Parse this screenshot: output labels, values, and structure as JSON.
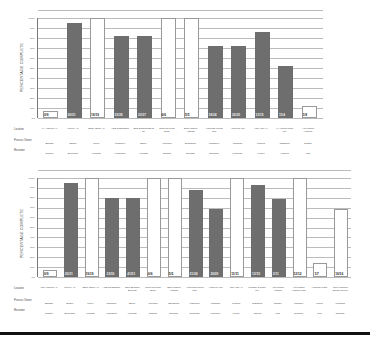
{
  "charts": [
    {
      "ylabel": "PERCENTAGE COMPLETE",
      "yticks": [
        "0%",
        "10%",
        "20%",
        "30%",
        "40%",
        "50%",
        "60%",
        "70%",
        "80%",
        "90%",
        "100%"
      ],
      "row_labels": [
        "Location",
        "Process Owner",
        "Reviewer"
      ],
      "columns": [
        {
          "value_label": "0/9",
          "pct": 0,
          "style": "frame",
          "location": "LA Angeles Air",
          "owner": "Bigham",
          "reviewer": "Dimalo"
        },
        {
          "value_label": "20/21",
          "pct": 95,
          "style": "bar",
          "location": "Loveny Air",
          "owner": "Shafer",
          "reviewer": "Brunnode"
        },
        {
          "value_label": "19/19",
          "pct": 100,
          "style": "frame",
          "location": "Saldy Office Air",
          "owner": "Tuney",
          "reviewer": "Mientak"
        },
        {
          "value_label": "23/28",
          "pct": 82,
          "style": "bar",
          "location": "AGE Roadamble",
          "owner": "Lahomen",
          "reviewer": "Hewnborn"
        },
        {
          "value_label": "23/27",
          "pct": 82,
          "style": "bar",
          "location": "Ohio Beading Bend St",
          "owner": "Bitcoy",
          "reviewer": "Helnodo"
        },
        {
          "value_label": "6/6",
          "pct": 100,
          "style": "frame",
          "location": "Nucleus Press Study",
          "owner": "Vibrunde",
          "reviewer": "Dianide"
        },
        {
          "value_label": "5/5",
          "pct": 100,
          "style": "frame",
          "location": "Sitar Models Antonde",
          "owner": "Brombock",
          "reviewer": "Dianode"
        },
        {
          "value_label": "18/24",
          "pct": 72,
          "style": "bar",
          "location": "Americas Forest Rim",
          "owner": "Lahomen",
          "reviewer": "Dunnhan"
        },
        {
          "value_label": "20/25",
          "pct": 72,
          "style": "bar",
          "location": "Along Tie Mill",
          "owner": "Whitman",
          "reviewer": "Welkome"
        },
        {
          "value_label": "13/15",
          "pct": 86,
          "style": "bar",
          "location": "Las Allan All",
          "owner": "Plannis",
          "reviewer": "Lienell"
        },
        {
          "value_label": "11/4",
          "pct": 52,
          "style": "bar",
          "location": "All Anionic Tinge Mill",
          "owner": "Justamus",
          "reviewer": "Amsvug"
        },
        {
          "value_label": "1/8",
          "pct": 12,
          "style": "frame",
          "location": "Alto Modes Aimtone",
          "owner": "Disade",
          "reviewer": "Wall"
        }
      ]
    },
    {
      "ylabel": "PERCENTAGE COMPLETE",
      "yticks": [
        "0%",
        "10%",
        "20%",
        "30%",
        "40%",
        "50%",
        "60%",
        "70%",
        "80%",
        "90%",
        "100%"
      ],
      "row_labels": [
        "Location",
        "Process Owner",
        "Reviewer"
      ],
      "columns": [
        {
          "value_label": "0/9",
          "pct": 0,
          "style": "frame",
          "location": "Los Angeles Air",
          "owner": "Bigham",
          "reviewer": "Dimalo"
        },
        {
          "value_label": "20/21",
          "pct": 95,
          "style": "bar",
          "location": "Loveny Air",
          "owner": "Shafer",
          "reviewer": "Brunnode"
        },
        {
          "value_label": "19/19",
          "pct": 100,
          "style": "frame",
          "location": "Saldy Office Air",
          "owner": "Tuney",
          "reviewer": "Mientak"
        },
        {
          "value_label": "23/30",
          "pct": 80,
          "style": "bar",
          "location": "AGE Roadamble",
          "owner": "Lahomen",
          "reviewer": "Hewnborn"
        },
        {
          "value_label": "41/51",
          "pct": 80,
          "style": "bar",
          "location": "Ohio Beading Bend St",
          "owner": "Bitcoy",
          "reviewer": "Helnodo"
        },
        {
          "value_label": "6/6",
          "pct": 100,
          "style": "frame",
          "location": "Nucleus Press Study",
          "owner": "Vibrunde",
          "reviewer": "Dianide"
        },
        {
          "value_label": "5/5",
          "pct": 100,
          "style": "frame",
          "location": "Sitar Models Antonde",
          "owner": "Brombock",
          "reviewer": "Dianode"
        },
        {
          "value_label": "21/24",
          "pct": 88,
          "style": "bar",
          "location": "Americas Forest Rim",
          "owner": "Lahomen",
          "reviewer": "Dunnhan"
        },
        {
          "value_label": "20/29",
          "pct": 69,
          "style": "bar",
          "location": "Along Tie Mill",
          "owner": "Whitman",
          "reviewer": "Welkome"
        },
        {
          "value_label": "11/11",
          "pct": 100,
          "style": "frame",
          "location": "Las Allan All",
          "owner": "Plannis",
          "reviewer": "Lienell"
        },
        {
          "value_label": "13/15",
          "pct": 93,
          "style": "bar",
          "location": "Windsor & Tinge Mill",
          "owner": "Justamus",
          "reviewer": "Amsvug"
        },
        {
          "value_label": "3/11",
          "pct": 79,
          "style": "bar",
          "location": "Alto Modes Aimtone",
          "owner": "Disade",
          "reviewer": "Wall"
        },
        {
          "value_label": "12/12",
          "pct": 100,
          "style": "frame",
          "location": "Alto Modes Aimtone LTD",
          "owner": "Landlore",
          "reviewer": "Dianode"
        },
        {
          "value_label": "1/7",
          "pct": 14,
          "style": "frame",
          "location": "Humidor Plant",
          "owner": "Lonus",
          "reviewer": "Wall"
        },
        {
          "value_label": "10/16",
          "pct": 69,
          "style": "frame",
          "location": "Glen Lowning Bourke St Mill",
          "owner": "Longford",
          "reviewer": "Dianode"
        }
      ]
    }
  ],
  "chart_data": [
    {
      "type": "bar",
      "title": "",
      "xlabel": "",
      "ylabel": "PERCENTAGE COMPLETE",
      "ylim": [
        0,
        100
      ],
      "grid": true,
      "categories": [
        "LA Angeles Air",
        "Loveny Air",
        "Saldy Office Air",
        "AGE Roadamble",
        "Ohio Beading Bend St",
        "Nucleus Press Study",
        "Sitar Models Antonde",
        "Americas Forest Rim",
        "Along Tie Mill",
        "Las Allan All",
        "All Anionic Tinge Mill",
        "Alto Modes Aimtone"
      ],
      "values": [
        0,
        95,
        100,
        82,
        82,
        100,
        100,
        72,
        72,
        86,
        52,
        12
      ],
      "data_labels": [
        "0/9",
        "20/21",
        "19/19",
        "23/28",
        "23/27",
        "6/6",
        "5/5",
        "18/24",
        "20/25",
        "13/15",
        "11/4",
        "1/8"
      ]
    },
    {
      "type": "bar",
      "title": "",
      "xlabel": "",
      "ylabel": "PERCENTAGE COMPLETE",
      "ylim": [
        0,
        100
      ],
      "grid": true,
      "categories": [
        "Los Angeles Air",
        "Loveny Air",
        "Saldy Office Air",
        "AGE Roadamble",
        "Ohio Beading Bend St",
        "Nucleus Press Study",
        "Sitar Models Antonde",
        "Americas Forest Rim",
        "Along Tie Mill",
        "Las Allan All",
        "Windsor & Tinge Mill",
        "Alto Modes Aimtone",
        "Alto Modes Aimtone LTD",
        "Humidor Plant",
        "Glen Lowning Bourke St Mill"
      ],
      "values": [
        0,
        95,
        100,
        80,
        80,
        100,
        100,
        88,
        69,
        100,
        93,
        79,
        100,
        14,
        69
      ],
      "data_labels": [
        "0/9",
        "20/21",
        "19/19",
        "23/30",
        "41/51",
        "6/6",
        "5/5",
        "21/24",
        "20/29",
        "11/11",
        "13/15",
        "3/11",
        "12/12",
        "1/7",
        "10/16"
      ]
    }
  ]
}
